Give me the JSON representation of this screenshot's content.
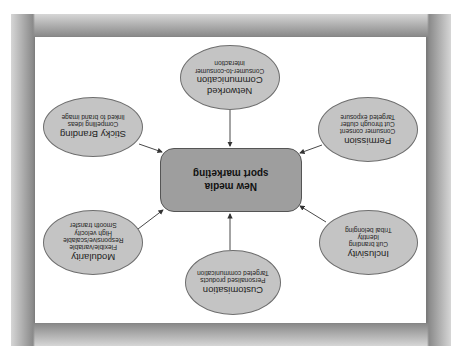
{
  "diagram": {
    "orientation": "rotated 180 degrees",
    "center": {
      "title_line1": "New media",
      "title_line2": "sport marketing"
    },
    "nodes": [
      {
        "id": "networked",
        "title_line1": "Networked",
        "title_line2": "Communication",
        "lines": [
          "Consumer-to-consumer",
          "interaction"
        ]
      },
      {
        "id": "permission",
        "title_line1": "Permission",
        "title_line2": "",
        "lines": [
          "Consumer consent",
          "Cut through clutter",
          "Targeted exposure"
        ]
      },
      {
        "id": "inclusivity",
        "title_line1": "Inclusivity",
        "title_line2": "",
        "lines": [
          "Cult branding",
          "Identity",
          "Tribal belonging"
        ]
      },
      {
        "id": "customisation",
        "title_line1": "Customisation",
        "title_line2": "",
        "lines": [
          "Personalised products",
          "Targeted communication"
        ]
      },
      {
        "id": "modularity",
        "title_line1": "Modularity",
        "title_line2": "",
        "lines": [
          "Flexible/variable",
          "Responsive/scalable",
          "High velocity",
          "Smooth transfer"
        ]
      },
      {
        "id": "sticky-branding",
        "title_line1": "Sticky Branding",
        "title_line2": "",
        "lines": [
          "Compelling ideas",
          "linked to brand image"
        ]
      }
    ]
  },
  "colors": {
    "ellipse_fill": "#c4c4c4",
    "center_fill": "#9e9e9e",
    "frame": "#7a7a7a",
    "panel": "#ffffff",
    "arrow": "#333333"
  }
}
